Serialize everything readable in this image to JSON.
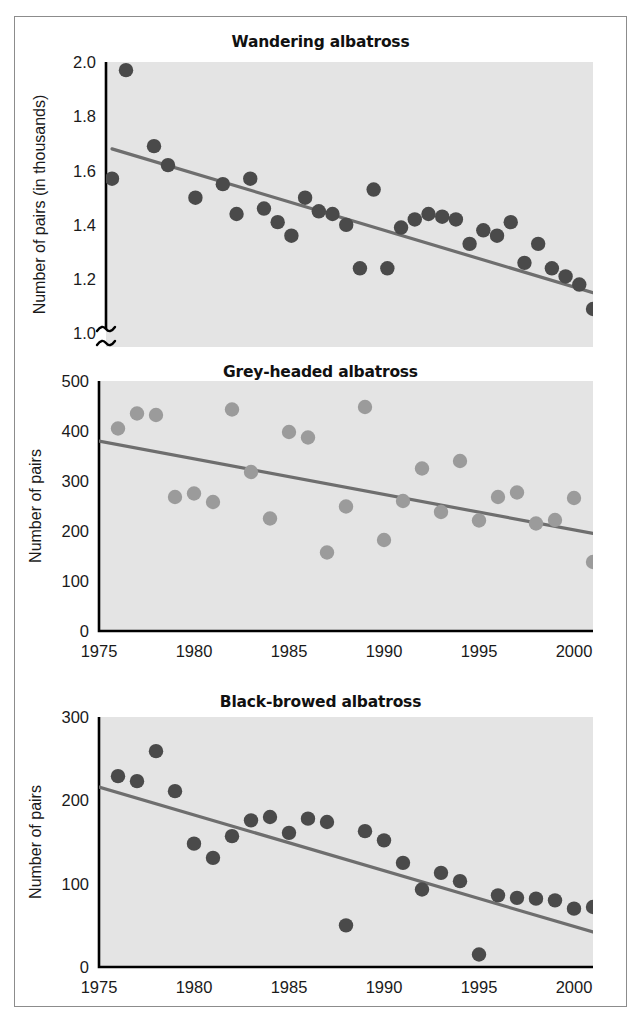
{
  "figure": {
    "border_color": "#8c8c8c",
    "background": "#ffffff"
  },
  "chart_data": [
    {
      "type": "scatter",
      "title": "Wandering albatross",
      "xlabel": "",
      "ylabel": "Number of pairs (in thousands)",
      "plot_background": "#e4e4e4",
      "point_color": "#4a4a4a",
      "trend_color": "#6e6e6e",
      "grid": false,
      "legend": "none",
      "xlim": [
        1960,
        2001
      ],
      "ylim": [
        0.95,
        2.0
      ],
      "y_axis_break": true,
      "x_axis_break": true,
      "xticks": [
        1960,
        1975,
        1980,
        1985,
        1990,
        1995,
        2000
      ],
      "xticklabels": [
        "1960s",
        "1975",
        "1980",
        "1985",
        "1990",
        "1995",
        "2000"
      ],
      "yticks": [
        0,
        1.0,
        1.2,
        1.4,
        1.6,
        1.8,
        2.0
      ],
      "yticklabels": [
        "0",
        "1.0",
        "1.2",
        "1.4",
        "1.6",
        "1.8",
        "2.0"
      ],
      "x": [
        1960,
        1962,
        1966,
        1970,
        1972,
        1974,
        1975,
        1976,
        1977,
        1978,
        1979,
        1980,
        1981,
        1982,
        1983,
        1984,
        1985,
        1986,
        1987,
        1988,
        1989,
        1990,
        1991,
        1992,
        1993,
        1994,
        1995,
        1996,
        1997,
        1998,
        1999,
        2000,
        2001
      ],
      "y": [
        1.57,
        1.97,
        1.69,
        1.62,
        1.5,
        1.55,
        1.44,
        1.57,
        1.46,
        1.41,
        1.36,
        1.5,
        1.45,
        1.44,
        1.4,
        1.24,
        1.53,
        1.24,
        1.39,
        1.42,
        1.44,
        1.43,
        1.42,
        1.33,
        1.38,
        1.36,
        1.41,
        1.26,
        1.33,
        1.24,
        1.21,
        1.18,
        1.09
      ],
      "trend": {
        "x0": 1960,
        "y0": 1.68,
        "x1": 2001,
        "y1": 1.15
      }
    },
    {
      "type": "scatter",
      "title": "Grey-headed albatross",
      "xlabel": "",
      "ylabel": "Number of pairs",
      "plot_background": "#e4e4e4",
      "point_color": "#9b9b9b",
      "trend_color": "#6e6e6e",
      "grid": false,
      "legend": "none",
      "xlim": [
        1975,
        2001
      ],
      "ylim": [
        0,
        500
      ],
      "y_axis_break": false,
      "x_axis_break": false,
      "xticks": [
        1975,
        1980,
        1985,
        1990,
        1995,
        2000
      ],
      "xticklabels": [
        "1975",
        "1980",
        "1985",
        "1990",
        "1995",
        "2000"
      ],
      "yticks": [
        0,
        100,
        200,
        300,
        400,
        500
      ],
      "yticklabels": [
        "0",
        "100",
        "200",
        "300",
        "400",
        "500"
      ],
      "x": [
        1976,
        1977,
        1978,
        1979,
        1980,
        1981,
        1982,
        1983,
        1984,
        1985,
        1986,
        1987,
        1988,
        1989,
        1990,
        1991,
        1992,
        1993,
        1994,
        1995,
        1996,
        1997,
        1998,
        1999,
        2000,
        2001
      ],
      "y": [
        405,
        435,
        432,
        268,
        275,
        258,
        443,
        318,
        225,
        398,
        387,
        157,
        249,
        448,
        182,
        260,
        325,
        238,
        340,
        221,
        268,
        277,
        215,
        222,
        266,
        138
      ],
      "trend": {
        "x0": 1975,
        "y0": 380,
        "x1": 2001,
        "y1": 195
      }
    },
    {
      "type": "scatter",
      "title": "Black-browed albatross",
      "xlabel": "",
      "ylabel": "Number of pairs",
      "plot_background": "#e4e4e4",
      "point_color": "#4a4a4a",
      "trend_color": "#6e6e6e",
      "grid": false,
      "legend": "none",
      "xlim": [
        1975,
        2001
      ],
      "ylim": [
        0,
        300
      ],
      "y_axis_break": false,
      "x_axis_break": false,
      "xticks": [
        1975,
        1980,
        1985,
        1990,
        1995,
        2000
      ],
      "xticklabels": [
        "1975",
        "1980",
        "1985",
        "1990",
        "1995",
        "2000"
      ],
      "yticks": [
        0,
        100,
        200,
        300
      ],
      "yticklabels": [
        "0",
        "100",
        "200",
        "300"
      ],
      "x": [
        1976,
        1977,
        1978,
        1979,
        1980,
        1981,
        1982,
        1983,
        1984,
        1985,
        1986,
        1987,
        1988,
        1989,
        1990,
        1991,
        1992,
        1993,
        1994,
        1995,
        1996,
        1997,
        1998,
        1999,
        2000,
        2001
      ],
      "y": [
        229,
        223,
        259,
        211,
        148,
        131,
        157,
        176,
        180,
        161,
        178,
        174,
        50,
        163,
        152,
        125,
        93,
        113,
        103,
        15,
        86,
        83,
        82,
        80,
        70,
        72
      ],
      "trend": {
        "x0": 1975,
        "y0": 216,
        "x1": 2001,
        "y1": 42
      }
    }
  ]
}
